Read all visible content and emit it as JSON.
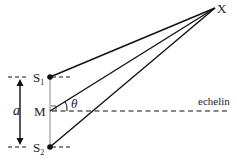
{
  "diagram": {
    "type": "double-slit geometry",
    "labels": {
      "x_point": "X",
      "s1": "S",
      "s1_sub": "1",
      "s2": "S",
      "s2_sub": "2",
      "m": "M",
      "theta": "θ",
      "a": "a",
      "echelin": "echelin"
    },
    "colors": {
      "line": "#111111",
      "thin_line": "#555555",
      "background": "#ffffff"
    }
  }
}
